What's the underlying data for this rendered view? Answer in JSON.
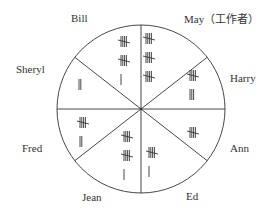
{
  "diagram": {
    "center": [
      141,
      109
    ],
    "radius": 84,
    "line_color": "#333333",
    "segments": [
      {
        "name": "Bill",
        "tally": 11,
        "label_pos": [
          71,
          12
        ]
      },
      {
        "name": "May（工作者）",
        "tally": 15,
        "label_pos": [
          184,
          13
        ]
      },
      {
        "name": "Harry",
        "tally": 8,
        "label_pos": [
          230,
          72
        ]
      },
      {
        "name": "Ann",
        "tally": 5,
        "label_pos": [
          230,
          142
        ]
      },
      {
        "name": "Ed",
        "tally": 6,
        "label_pos": [
          186,
          190
        ]
      },
      {
        "name": "Jean",
        "tally": 11,
        "label_pos": [
          82,
          191
        ]
      },
      {
        "name": "Fred",
        "tally": 7,
        "label_pos": [
          22,
          142
        ]
      },
      {
        "name": "Sheryl",
        "tally": 2,
        "label_pos": [
          16,
          63
        ]
      }
    ]
  }
}
